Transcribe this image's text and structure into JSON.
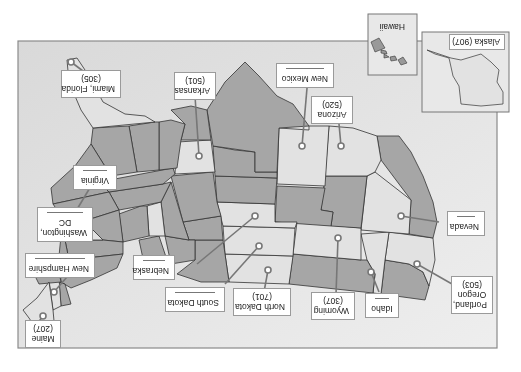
{
  "map": {
    "title": "United States area code map",
    "orientation_degrees": 180,
    "colors": {
      "background": "#ffffff",
      "frame_border": "#8a8a8a",
      "frame_fill": "#e6e6e6",
      "dark_state": "#a6a6a6",
      "light_state": "#e2e2e2",
      "state_border": "#333333",
      "leader_line": "#777777",
      "label_border": "#9a9a9a"
    }
  },
  "insets": {
    "alaska": {
      "label": "Alaska (907)"
    },
    "hawaii": {
      "label": "Hawaii"
    }
  },
  "labels": [
    {
      "id": "portland-oregon",
      "line1": "Portland,",
      "line2": "Oregon",
      "line3": "(503)",
      "blank": false
    },
    {
      "id": "nevada",
      "line1": "Nevada",
      "blank": true
    },
    {
      "id": "idaho",
      "line1": "Idaho",
      "blank": true
    },
    {
      "id": "wyoming",
      "line1": "Wyoming",
      "line2": "(307)",
      "blank": false
    },
    {
      "id": "north-dakota",
      "line1": "North Dakota",
      "line2": "(701)",
      "blank": false
    },
    {
      "id": "south-dakota",
      "line1": "South Dakota",
      "blank": true
    },
    {
      "id": "nebraska",
      "line1": "Nebraska",
      "blank": true
    },
    {
      "id": "maine",
      "line1": "Maine",
      "line2": "(207)",
      "blank": false
    },
    {
      "id": "new-hampshire",
      "line1": "New Hampshire",
      "blank": true
    },
    {
      "id": "washington-dc",
      "line1": "Washington,",
      "line2": "DC",
      "blank": true
    },
    {
      "id": "virginia",
      "line1": "Virginia",
      "blank": true
    },
    {
      "id": "miami-florida",
      "line1": "Miami, Florida",
      "line2": "(305)",
      "blank": false
    },
    {
      "id": "arkansas",
      "line1": "Arkansas",
      "line2": "(501)",
      "blank": false
    },
    {
      "id": "new-mexico",
      "line1": "New Mexico",
      "blank": true
    },
    {
      "id": "arizona",
      "line1": "Arizona",
      "line2": "(520)",
      "blank": false
    }
  ]
}
